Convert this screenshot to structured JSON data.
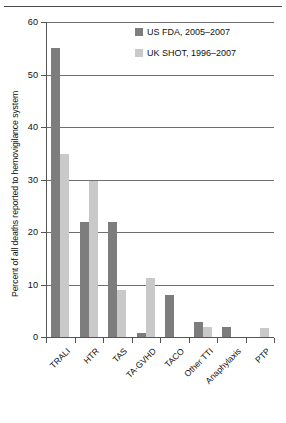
{
  "chart_data": {
    "type": "bar",
    "title": "",
    "xlabel": "",
    "ylabel": "Percent of all deaths reported to hemovigilance system",
    "ylim": [
      0,
      60
    ],
    "yticks": [
      0,
      10,
      20,
      30,
      40,
      50,
      60
    ],
    "ytick_labels": [
      "0",
      "10",
      "20",
      "30",
      "40",
      "50",
      "60"
    ],
    "grid": true,
    "legend_position": "top-right",
    "categories": [
      "TRALI",
      "HTR",
      "TAS",
      "TA-GVHD",
      "TACO",
      "Other TTI",
      "Anaphylaxis",
      "PTP"
    ],
    "series": [
      {
        "name": "US FDA, 2005–2007",
        "color": "#7d7d7d",
        "values": [
          55,
          22,
          22,
          0.7,
          8,
          2.8,
          2,
          0
        ]
      },
      {
        "name": "UK SHOT, 1996–2007",
        "color": "#c9c9c9",
        "values": [
          34.8,
          29.7,
          9,
          11.3,
          0,
          2,
          0,
          1.7
        ]
      }
    ]
  },
  "legend": {
    "items": [
      {
        "label": "US FDA, 2005–2007",
        "swatch": "dark-gray-swatch"
      },
      {
        "label": "UK SHOT, 1996–2007",
        "swatch": "light-gray-swatch"
      }
    ]
  }
}
